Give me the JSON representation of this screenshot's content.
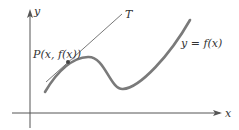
{
  "diagram": {
    "axes": {
      "x_label": "x",
      "y_label": "y"
    },
    "curve": {
      "label": "y = f(x)",
      "color": "#777777"
    },
    "tangent": {
      "label": "T",
      "color": "#555555"
    },
    "point": {
      "label": "P(x, f(x))"
    }
  }
}
